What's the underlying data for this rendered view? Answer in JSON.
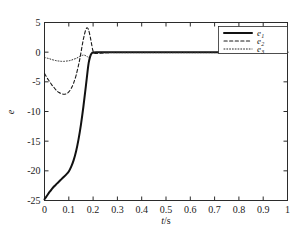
{
  "chart_data": {
    "type": "line",
    "title": "",
    "xlabel": "t/s",
    "ylabel": "e",
    "xlim": [
      0,
      1
    ],
    "ylim": [
      -25,
      5
    ],
    "xticks": [
      "0",
      "0.1",
      "0.2",
      "0.3",
      "0.4",
      "0.5",
      "0.6",
      "0.7",
      "0.8",
      "0.9",
      "1"
    ],
    "xtick_values": [
      0,
      0.1,
      0.2,
      0.3,
      0.4,
      0.5,
      0.6,
      0.7,
      0.8,
      0.9,
      1
    ],
    "yticks": [
      "5",
      "0",
      "-5",
      "-10",
      "-15",
      "-20",
      "-25"
    ],
    "ytick_values": [
      5,
      0,
      -5,
      -10,
      -15,
      -20,
      -25
    ],
    "grid": false,
    "legend_position": "top-right",
    "legend": [
      "e1",
      "e2",
      "e3"
    ],
    "series": [
      {
        "name": "e1",
        "label": "e",
        "subscript": "1",
        "style": "solid",
        "color": "#111111",
        "width": 2.0,
        "x": [
          0,
          0.01,
          0.02,
          0.03,
          0.04,
          0.05,
          0.06,
          0.07,
          0.08,
          0.09,
          0.1,
          0.11,
          0.12,
          0.13,
          0.14,
          0.15,
          0.16,
          0.17,
          0.18,
          0.185,
          0.19,
          0.195,
          0.2,
          0.22,
          0.25,
          0.3,
          0.4,
          0.5,
          0.6,
          0.7,
          0.8,
          0.9,
          1.0
        ],
        "y": [
          -24.8,
          -24.2,
          -23.6,
          -23.1,
          -22.6,
          -22.2,
          -21.8,
          -21.4,
          -21.0,
          -20.6,
          -20.1,
          -19.3,
          -18.2,
          -16.7,
          -14.7,
          -12.2,
          -9.2,
          -5.8,
          -2.3,
          -1.2,
          -0.5,
          -0.15,
          -0.05,
          -0.03,
          -0.02,
          -0.02,
          -0.02,
          -0.02,
          -0.02,
          -0.02,
          -0.02,
          -0.02,
          -0.02
        ]
      },
      {
        "name": "e2",
        "label": "e",
        "subscript": "2",
        "style": "dashed",
        "color": "#1a1a1a",
        "width": 1.1,
        "x": [
          0,
          0.01,
          0.02,
          0.03,
          0.04,
          0.05,
          0.06,
          0.07,
          0.08,
          0.09,
          0.1,
          0.11,
          0.12,
          0.13,
          0.14,
          0.145,
          0.15,
          0.155,
          0.16,
          0.165,
          0.17,
          0.175,
          0.18,
          0.185,
          0.19,
          0.195,
          0.2,
          0.21,
          0.25,
          0.3,
          0.4,
          0.5,
          0.6,
          0.7,
          0.8,
          0.9,
          1.0
        ],
        "y": [
          -3.6,
          -4.3,
          -4.9,
          -5.5,
          -6.0,
          -6.5,
          -6.8,
          -7.0,
          -7.1,
          -7.0,
          -6.7,
          -6.1,
          -5.2,
          -3.9,
          -2.2,
          -1.2,
          -0.1,
          1.1,
          2.2,
          3.1,
          3.8,
          4.1,
          3.9,
          3.2,
          2.2,
          1.1,
          0.2,
          -0.2,
          -0.1,
          -0.05,
          -0.05,
          -0.05,
          -0.05,
          -0.05,
          -0.05,
          -0.05,
          -0.05
        ]
      },
      {
        "name": "e3",
        "label": "e",
        "subscript": "3",
        "style": "dotted",
        "color": "#2a2a2a",
        "width": 1.0,
        "x": [
          0,
          0.01,
          0.02,
          0.03,
          0.04,
          0.05,
          0.06,
          0.07,
          0.08,
          0.09,
          0.1,
          0.11,
          0.12,
          0.13,
          0.14,
          0.15,
          0.155,
          0.16,
          0.165,
          0.17,
          0.175,
          0.18,
          0.19,
          0.2,
          0.25,
          0.3,
          0.4,
          0.5,
          0.6,
          0.7,
          0.8,
          0.9,
          1.0
        ],
        "y": [
          -0.9,
          -1.0,
          -1.1,
          -1.25,
          -1.35,
          -1.45,
          -1.5,
          -1.55,
          -1.55,
          -1.5,
          -1.45,
          -1.35,
          -1.2,
          -1.05,
          -0.85,
          -0.62,
          -0.55,
          -0.5,
          -0.52,
          -0.6,
          -0.72,
          -0.85,
          -0.6,
          -0.2,
          -0.08,
          -0.08,
          -0.08,
          -0.08,
          -0.08,
          -0.08,
          -0.08,
          -0.08,
          -0.08
        ]
      }
    ]
  },
  "colors": {
    "frame": "#2b2b2b",
    "background": "#ffffff",
    "text": "#1a1a1a"
  }
}
